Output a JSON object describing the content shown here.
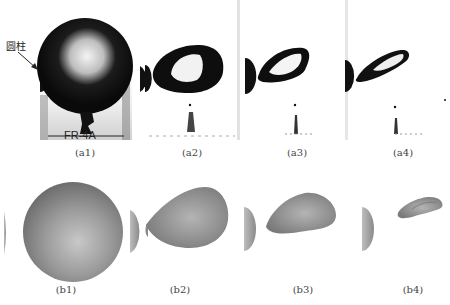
{
  "figure": {
    "annotation": {
      "label": "圆柱",
      "meaning": "cylinder"
    },
    "top_row": {
      "description": "experimental photographs",
      "panels": [
        {
          "id": "a1",
          "caption": "(a1)",
          "plate_text": "FR-4A"
        },
        {
          "id": "a2",
          "caption": "(a2)"
        },
        {
          "id": "a3",
          "caption": "(a3)"
        },
        {
          "id": "a4",
          "caption": "(a4)"
        }
      ]
    },
    "bottom_row": {
      "description": "numerical simulation renderings",
      "panels": [
        {
          "id": "b1",
          "caption": "(b1)"
        },
        {
          "id": "b2",
          "caption": "(b2)"
        },
        {
          "id": "b3",
          "caption": "(b3)"
        },
        {
          "id": "b4",
          "caption": "(b4)"
        }
      ]
    },
    "colors": {
      "background": "#ffffff",
      "photo_dark": "#111111",
      "render_gray": "#8c8c8c",
      "caption_text": "#444444"
    }
  }
}
